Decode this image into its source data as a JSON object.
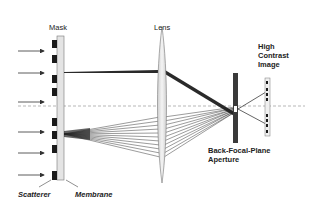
{
  "labels": {
    "mask": "Mask",
    "lens": "Lens",
    "image_line1": "High",
    "image_line2": "Contrast",
    "image_line3": "Image",
    "aperture_line1": "Back-Focal-Plane",
    "aperture_line2": "Aperture",
    "scatterer": "Scatterer",
    "membrane": "Membrane"
  },
  "colors": {
    "membrane_fill": "#e4e4e4",
    "scatterer": "#1a1a1a",
    "aperture": "#3a3a3a",
    "rays": "#222222",
    "axis": "#999999"
  }
}
